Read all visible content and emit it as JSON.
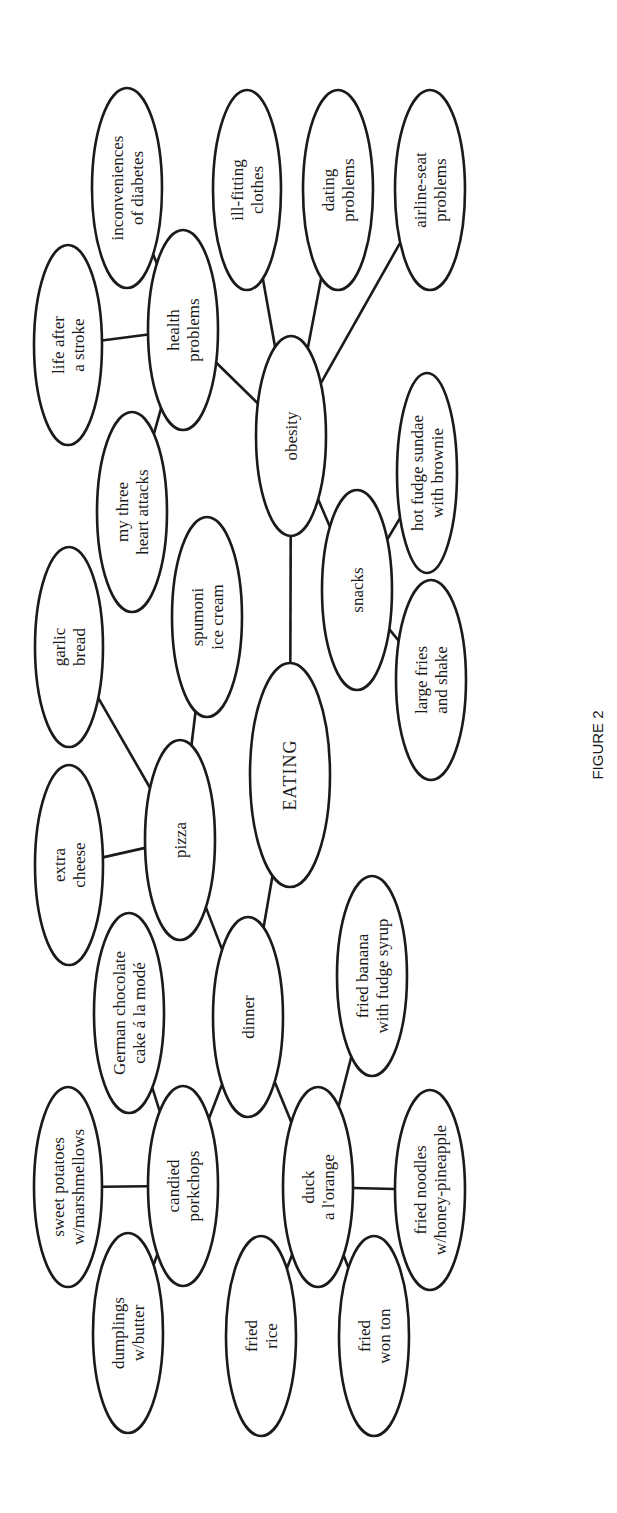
{
  "figure": {
    "caption": "FIGURE 2",
    "orientation": "rotated-90-ccw",
    "colors": {
      "stroke": "#1a1a1a",
      "background": "#ffffff",
      "text": "#1a1a1a"
    }
  },
  "root": {
    "id": "eating",
    "label": "EATING"
  },
  "nodes": [
    {
      "id": "eating",
      "lines": [
        "EATING"
      ],
      "cx": 290,
      "cy": 775,
      "rx": 40,
      "ry": 112
    },
    {
      "id": "dinner",
      "lines": [
        "dinner"
      ],
      "cx": 248,
      "cy": 1017,
      "rx": 35,
      "ry": 100
    },
    {
      "id": "obesity",
      "lines": [
        "obesity"
      ],
      "cx": 291,
      "cy": 436,
      "rx": 35,
      "ry": 100
    },
    {
      "id": "pizza",
      "lines": [
        "pizza"
      ],
      "cx": 180,
      "cy": 840,
      "rx": 35,
      "ry": 100
    },
    {
      "id": "candied-porkchops",
      "lines": [
        "candied",
        "porkchops"
      ],
      "cx": 183,
      "cy": 1186,
      "rx": 35,
      "ry": 100
    },
    {
      "id": "duck-a-lorange",
      "lines": [
        "duck",
        "a l'orange"
      ],
      "cx": 318,
      "cy": 1187,
      "rx": 35,
      "ry": 100
    },
    {
      "id": "german-chocolate-cake",
      "lines": [
        "German chocolate",
        "cake á la modé"
      ],
      "cx": 129,
      "cy": 1013,
      "rx": 35,
      "ry": 100
    },
    {
      "id": "extra-cheese",
      "lines": [
        "extra",
        "cheese"
      ],
      "cx": 69,
      "cy": 865,
      "rx": 34,
      "ry": 100
    },
    {
      "id": "garlic-bread",
      "lines": [
        "garlic",
        "bread"
      ],
      "cx": 69,
      "cy": 647,
      "rx": 34,
      "ry": 100
    },
    {
      "id": "spumoni-ice-cream",
      "lines": [
        "spumoni",
        "ice cream"
      ],
      "cx": 207,
      "cy": 617,
      "rx": 35,
      "ry": 100
    },
    {
      "id": "my-three-heart-attacks",
      "lines": [
        "my three",
        "heart attacks"
      ],
      "cx": 132,
      "cy": 512,
      "rx": 35,
      "ry": 100
    },
    {
      "id": "health-problems",
      "lines": [
        "health",
        "problems"
      ],
      "cx": 183,
      "cy": 330,
      "rx": 35,
      "ry": 100
    },
    {
      "id": "life-after-a-stroke",
      "lines": [
        "life after",
        "a stroke"
      ],
      "cx": 68,
      "cy": 345,
      "rx": 34,
      "ry": 100
    },
    {
      "id": "inconveniences-of-diabetes",
      "lines": [
        "inconveniences",
        "of diabetes"
      ],
      "cx": 127,
      "cy": 188,
      "rx": 35,
      "ry": 100
    },
    {
      "id": "ill-fitting-clothes",
      "lines": [
        "ill-fitting",
        "clothes"
      ],
      "cx": 247,
      "cy": 190,
      "rx": 34,
      "ry": 100
    },
    {
      "id": "dating-problems",
      "lines": [
        "dating",
        "problems"
      ],
      "cx": 338,
      "cy": 190,
      "rx": 35,
      "ry": 100
    },
    {
      "id": "airline-seat-problems",
      "lines": [
        "airline-seat",
        "problems"
      ],
      "cx": 430,
      "cy": 190,
      "rx": 35,
      "ry": 100
    },
    {
      "id": "snacks",
      "lines": [
        "snacks"
      ],
      "cx": 357,
      "cy": 590,
      "rx": 35,
      "ry": 100
    },
    {
      "id": "hot-fudge-sundae",
      "lines": [
        "hot fudge sundae",
        "with brownie"
      ],
      "cx": 427,
      "cy": 473,
      "rx": 30,
      "ry": 100
    },
    {
      "id": "large-fries-and-shake",
      "lines": [
        "large fries",
        "and shake"
      ],
      "cx": 431,
      "cy": 680,
      "rx": 35,
      "ry": 100
    },
    {
      "id": "fried-banana",
      "lines": [
        "fried banana",
        "with fudge syrup"
      ],
      "cx": 372,
      "cy": 976,
      "rx": 35,
      "ry": 100
    },
    {
      "id": "fried-noodles",
      "lines": [
        "fried noodles",
        "w/honey-pineapple"
      ],
      "cx": 430,
      "cy": 1190,
      "rx": 35,
      "ry": 100
    },
    {
      "id": "sweet-potatoes",
      "lines": [
        "sweet potatoes",
        "w/marshmellows"
      ],
      "cx": 68,
      "cy": 1187,
      "rx": 34,
      "ry": 100
    },
    {
      "id": "dumplings",
      "lines": [
        "dumplings",
        "w/butter"
      ],
      "cx": 128,
      "cy": 1333,
      "rx": 35,
      "ry": 100
    },
    {
      "id": "fried-rice",
      "lines": [
        "fried",
        "rice"
      ],
      "cx": 261,
      "cy": 1336,
      "rx": 35,
      "ry": 100
    },
    {
      "id": "fried-won-ton",
      "lines": [
        "fried",
        "won ton"
      ],
      "cx": 374,
      "cy": 1336,
      "rx": 35,
      "ry": 100
    }
  ],
  "edges": [
    [
      "eating",
      "obesity"
    ],
    [
      "eating",
      "dinner"
    ],
    [
      "obesity",
      "health-problems"
    ],
    [
      "obesity",
      "ill-fitting-clothes"
    ],
    [
      "obesity",
      "dating-problems"
    ],
    [
      "obesity",
      "airline-seat-problems"
    ],
    [
      "obesity",
      "snacks"
    ],
    [
      "health-problems",
      "life-after-a-stroke"
    ],
    [
      "health-problems",
      "inconveniences-of-diabetes"
    ],
    [
      "health-problems",
      "my-three-heart-attacks"
    ],
    [
      "snacks",
      "hot-fudge-sundae"
    ],
    [
      "snacks",
      "large-fries-and-shake"
    ],
    [
      "dinner",
      "pizza"
    ],
    [
      "dinner",
      "candied-porkchops"
    ],
    [
      "dinner",
      "duck-a-lorange"
    ],
    [
      "pizza",
      "extra-cheese"
    ],
    [
      "pizza",
      "garlic-bread"
    ],
    [
      "pizza",
      "spumoni-ice-cream"
    ],
    [
      "candied-porkchops",
      "german-chocolate-cake"
    ],
    [
      "candied-porkchops",
      "sweet-potatoes"
    ],
    [
      "candied-porkchops",
      "dumplings"
    ],
    [
      "duck-a-lorange",
      "fried-banana"
    ],
    [
      "duck-a-lorange",
      "fried-noodles"
    ],
    [
      "duck-a-lorange",
      "fried-rice"
    ],
    [
      "duck-a-lorange",
      "fried-won-ton"
    ]
  ],
  "caption_position": {
    "x": 598,
    "y": 745
  }
}
